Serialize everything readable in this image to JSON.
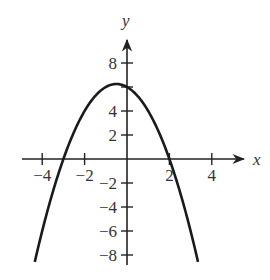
{
  "chart_data": {
    "type": "line",
    "title": "",
    "xlabel": "x",
    "ylabel": "y",
    "function": "y = -x^2 - x + 6",
    "xlim": [
      -4.3,
      3.3
    ],
    "ylim": [
      -9,
      8.5
    ],
    "x_ticks": [
      -4,
      -2,
      2,
      4
    ],
    "x_tick_labels": [
      "−4",
      "−2",
      "2",
      "4"
    ],
    "y_ticks": [
      8,
      6,
      4,
      2,
      -2,
      -4,
      -6,
      -8
    ],
    "y_tick_labels": [
      "8",
      "",
      "4",
      "2",
      "−2",
      "−4",
      "−6",
      "−8"
    ],
    "grid": false,
    "legend": null,
    "series": [
      {
        "name": "parabola",
        "x": [
          -4.3,
          -4,
          -3,
          -2,
          -1,
          -0.5,
          0,
          1,
          2,
          3,
          3.3
        ],
        "y": [
          -6.19,
          -6,
          0,
          4,
          6,
          6.25,
          6,
          4,
          0,
          -6,
          -8.19
        ]
      }
    ],
    "key_points": {
      "vertex": [
        -0.5,
        6.25
      ],
      "x_intercepts": [
        -3,
        2
      ],
      "y_intercept": 6
    }
  },
  "axes": {
    "x_label": "x",
    "y_label": "y"
  },
  "style": {
    "curve_color": "#1a1a1a",
    "axis_color": "#222222",
    "text_color": "#333333"
  }
}
